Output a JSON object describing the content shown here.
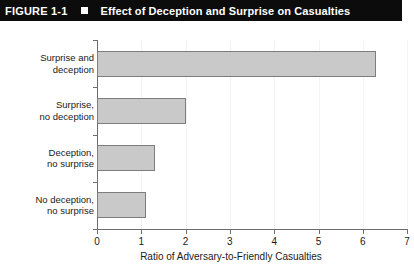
{
  "header": {
    "figure_number": "FIGURE 1-1",
    "bullet_icon": "square-bullet-icon",
    "title": "Effect of Deception and Surprise on Casualties",
    "background_color": "#0c0c0c",
    "text_color": "#ffffff"
  },
  "chart_data": {
    "type": "bar",
    "orientation": "horizontal",
    "title": "Effect of Deception and Surprise on Casualties",
    "categories": [
      "Surprise and deception",
      "Surprise, no deception",
      "Deception, no surprise",
      "No deception, no surprise"
    ],
    "category_lines": [
      [
        "Surprise and",
        "deception"
      ],
      [
        "Surprise,",
        "no deception"
      ],
      [
        "Deception,",
        "no surprise"
      ],
      [
        "No deception,",
        "no surprise"
      ]
    ],
    "values": [
      6.3,
      2.0,
      1.3,
      1.1
    ],
    "xlabel": "Ratio of Adversary-to-Friendly Casualties",
    "ylabel": "",
    "xlim": [
      0,
      7
    ],
    "xticks": [
      0,
      1,
      2,
      3,
      4,
      5,
      6,
      7
    ],
    "xtick_labels": [
      "0",
      "1",
      "2",
      "3",
      "4",
      "5",
      "6",
      "7"
    ],
    "grid": true,
    "legend": null,
    "bar_fill_color": "#c9c9c9",
    "bar_border_color": "#7d7d7d",
    "axis_color": "#6e6e6e",
    "gridline_color": "#f4f4f4"
  }
}
